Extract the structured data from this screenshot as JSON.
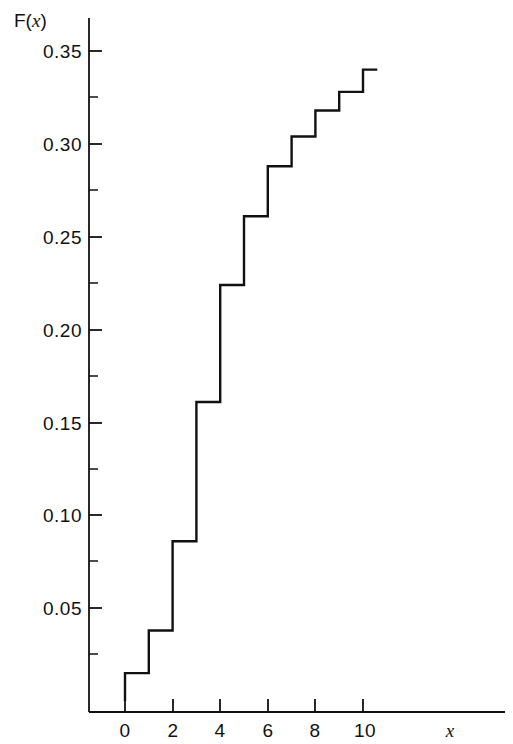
{
  "figure": {
    "background_color": "#ffffff",
    "line_color": "#111111",
    "ylabel": "F(",
    "ylabel_var": "x",
    "ylabel_close": ")",
    "xlabel": "x"
  },
  "chart_data": {
    "type": "line",
    "subtype": "step",
    "title": "",
    "subtitle": "",
    "xlabel": "x",
    "ylabel": "F(x)",
    "grid": false,
    "legend": false,
    "legend_position": "none",
    "xlim": [
      -1.2,
      15.5
    ],
    "ylim": [
      0,
      0.368
    ],
    "x_ticks": [
      0,
      2,
      4,
      6,
      8,
      10
    ],
    "x_tick_labels": [
      "0",
      "2",
      "4",
      "6",
      "8",
      "10"
    ],
    "x_minor_ticks": [
      1,
      3,
      5,
      7,
      9
    ],
    "y_ticks": [
      0.05,
      0.1,
      0.15,
      0.2,
      0.25,
      0.3,
      0.35
    ],
    "y_tick_labels": [
      "0.05",
      "0.10",
      "0.15",
      "0.20",
      "0.25",
      "0.30",
      "0.35"
    ],
    "y_minor_ticks": [
      0.025,
      0.075,
      0.125,
      0.175,
      0.225,
      0.275,
      0.325
    ],
    "x": [
      0,
      1,
      2,
      3,
      4,
      5,
      6,
      7,
      8,
      9,
      10
    ],
    "values": [
      0.015,
      0.038,
      0.086,
      0.161,
      0.224,
      0.261,
      0.288,
      0.304,
      0.318,
      0.328,
      0.34
    ],
    "step_start_x": 0,
    "step_end_x": 10.6,
    "series": [
      {
        "name": "F(x)",
        "values": [
          0.015,
          0.038,
          0.086,
          0.161,
          0.224,
          0.261,
          0.288,
          0.304,
          0.318,
          0.328,
          0.34
        ]
      }
    ]
  }
}
